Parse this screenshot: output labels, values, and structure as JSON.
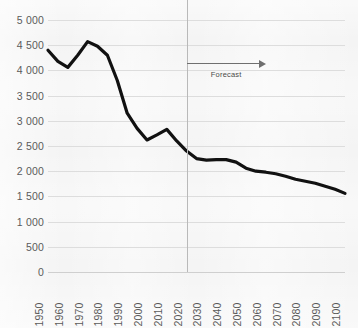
{
  "chart_data": {
    "type": "line",
    "title": "",
    "subtitle": "",
    "xlabel": "",
    "ylabel": "",
    "xlim": [
      1950,
      2100
    ],
    "ylim": [
      0,
      5000
    ],
    "grid": true,
    "legend": null,
    "x_tick_labels": [
      "1950",
      "1960",
      "1970",
      "1980",
      "1990",
      "2000",
      "2010",
      "2020",
      "2030",
      "2040",
      "2050",
      "2060",
      "2070",
      "2080",
      "2090",
      "2100"
    ],
    "y_tick_labels": [
      "0",
      "500",
      "1 000",
      "1 500",
      "2 000",
      "2 500",
      "3 000",
      "3 500",
      "4 000",
      "4 500",
      "5 000"
    ],
    "y_ticks": [
      0,
      500,
      1000,
      1500,
      2000,
      2500,
      3000,
      3500,
      4000,
      4500,
      5000
    ],
    "x": [
      1950,
      1955,
      1960,
      1965,
      1970,
      1975,
      1980,
      1985,
      1990,
      1995,
      2000,
      2005,
      2010,
      2015,
      2020,
      2025,
      2030,
      2035,
      2040,
      2045,
      2050,
      2055,
      2060,
      2065,
      2070,
      2075,
      2080,
      2085,
      2090,
      2095,
      2100
    ],
    "values": [
      4400,
      4180,
      4060,
      4300,
      4570,
      4480,
      4300,
      3800,
      3150,
      2850,
      2620,
      2720,
      2830,
      2600,
      2400,
      2250,
      2220,
      2230,
      2230,
      2180,
      2060,
      2000,
      1980,
      1950,
      1900,
      1840,
      1800,
      1760,
      1700,
      1640,
      1560
    ],
    "series": [
      {
        "name": "",
        "color": "#111111",
        "values": [
          4400,
          4180,
          4060,
          4300,
          4570,
          4480,
          4300,
          3800,
          3150,
          2850,
          2620,
          2720,
          2830,
          2600,
          2400,
          2250,
          2220,
          2230,
          2230,
          2180,
          2060,
          2000,
          1980,
          1950,
          1900,
          1840,
          1800,
          1760,
          1700,
          1640,
          1560
        ]
      }
    ],
    "annotations": [
      {
        "name": "forecast",
        "label": "Forecast",
        "type": "arrow-right",
        "x_start": 2020,
        "x_end": 2060,
        "y": 4150
      }
    ],
    "reference_lines": [
      {
        "name": "forecast-divider",
        "orientation": "vertical",
        "x": 2020,
        "color": "#b9b9b9"
      }
    ],
    "colors": {
      "line": "#111111",
      "grid": "#dddddd",
      "tick_text": "#5b5b5b",
      "annotation": "#6f6f6f",
      "background": "#f4f4f4"
    }
  }
}
